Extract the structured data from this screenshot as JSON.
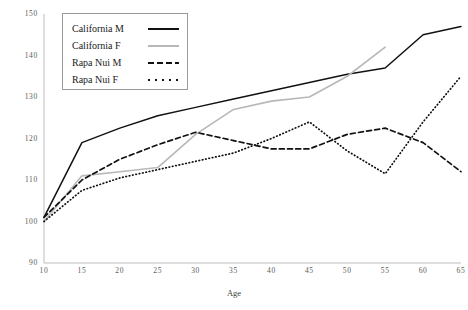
{
  "chart_data": {
    "type": "line",
    "title": "",
    "xlabel": "Age",
    "ylabel": "",
    "xlim": [
      10,
      65
    ],
    "ylim": [
      90,
      150
    ],
    "xticks": [
      10,
      15,
      20,
      25,
      30,
      35,
      40,
      45,
      50,
      55,
      60,
      65
    ],
    "yticks": [
      90,
      100,
      110,
      120,
      130,
      140,
      150
    ],
    "grid": false,
    "legend_position": "top-left",
    "series": [
      {
        "name": "California M",
        "style": "solid",
        "color": "#111111",
        "x": [
          10,
          15,
          20,
          25,
          30,
          35,
          40,
          45,
          50,
          55,
          60,
          65
        ],
        "values": [
          101,
          119,
          122.5,
          125.5,
          127.5,
          129.5,
          131.5,
          133.5,
          135.5,
          137,
          145,
          147
        ]
      },
      {
        "name": "California F",
        "style": "solid",
        "color": "#b8b8b8",
        "x": [
          10,
          15,
          20,
          25,
          30,
          35,
          40,
          45,
          50,
          55
        ],
        "values": [
          100,
          111,
          112,
          113,
          121,
          127,
          129,
          130,
          135,
          142
        ]
      },
      {
        "name": "Rapa Nui M",
        "style": "dashed",
        "color": "#111111",
        "x": [
          10,
          15,
          20,
          25,
          30,
          35,
          40,
          45,
          50,
          55,
          60,
          65
        ],
        "values": [
          101,
          110,
          115,
          118.5,
          121.5,
          119.5,
          117.5,
          117.5,
          121,
          122.5,
          119,
          112
        ]
      },
      {
        "name": "Rapa Nui F",
        "style": "dotted",
        "color": "#111111",
        "x": [
          10,
          15,
          20,
          25,
          30,
          35,
          40,
          45,
          50,
          55,
          60,
          65
        ],
        "values": [
          100,
          107.5,
          110.5,
          112.5,
          114.5,
          116.5,
          120,
          124,
          117,
          111.5,
          124,
          135
        ]
      }
    ]
  },
  "axis": {
    "y_tick_labels": [
      "150",
      "140",
      "130",
      "120",
      "110",
      "100",
      "90"
    ],
    "x_tick_labels": [
      "10",
      "15",
      "20",
      "25",
      "30",
      "35",
      "40",
      "45",
      "50",
      "55",
      "60",
      "65"
    ],
    "x_title": "Age"
  },
  "legend": {
    "items": [
      {
        "label": "California M",
        "swatch": "solid-black-line-swatch"
      },
      {
        "label": "California F",
        "swatch": "solid-gray-line-swatch"
      },
      {
        "label": "Rapa Nui M",
        "swatch": "dashed-black-line-swatch"
      },
      {
        "label": "Rapa Nui F",
        "swatch": "dotted-black-line-swatch"
      }
    ]
  }
}
